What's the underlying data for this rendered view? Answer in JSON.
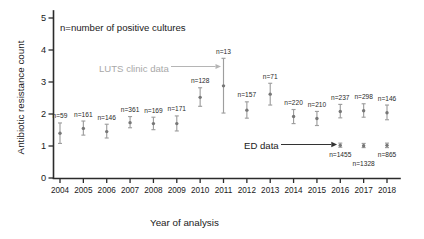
{
  "chart_data": {
    "type": "scatter",
    "title": "",
    "xlabel": "Year of analysis",
    "ylabel": "Antibiotic resistance count",
    "xlim": [
      2003.4,
      2018.7
    ],
    "ylim": [
      0,
      5.25
    ],
    "yticks": [
      0,
      1,
      2,
      3,
      4,
      5
    ],
    "grid": false,
    "legend": "none",
    "note": "n=number of positive cultures",
    "categories": [
      2004,
      2005,
      2006,
      2007,
      2008,
      2009,
      2010,
      2011,
      2012,
      2013,
      2014,
      2015,
      2016,
      2017,
      2018
    ],
    "series": [
      {
        "name": "LUTS clinic data",
        "color": "#777777",
        "errorbars": true,
        "points": [
          {
            "x": 2004,
            "y": 1.4,
            "lo": 1.08,
            "hi": 1.72,
            "n": 59,
            "n_label": "n=59",
            "label_pos": "above"
          },
          {
            "x": 2005,
            "y": 1.55,
            "lo": 1.34,
            "hi": 1.78,
            "n": 161,
            "n_label": "n=161",
            "label_pos": "above"
          },
          {
            "x": 2006,
            "y": 1.45,
            "lo": 1.25,
            "hi": 1.68,
            "n": 146,
            "n_label": "n=146",
            "label_pos": "above"
          },
          {
            "x": 2007,
            "y": 1.73,
            "lo": 1.57,
            "hi": 1.92,
            "n": 361,
            "n_label": "n=361",
            "label_pos": "above"
          },
          {
            "x": 2008,
            "y": 1.7,
            "lo": 1.51,
            "hi": 1.9,
            "n": 169,
            "n_label": "n=169",
            "label_pos": "above"
          },
          {
            "x": 2009,
            "y": 1.7,
            "lo": 1.47,
            "hi": 1.94,
            "n": 171,
            "n_label": "n=171",
            "label_pos": "above"
          },
          {
            "x": 2010,
            "y": 2.52,
            "lo": 2.24,
            "hi": 2.82,
            "n": 128,
            "n_label": "n=128",
            "label_pos": "above"
          },
          {
            "x": 2011,
            "y": 2.88,
            "lo": 2.03,
            "hi": 3.74,
            "n": 13,
            "n_label": "n=13",
            "label_pos": "above"
          },
          {
            "x": 2012,
            "y": 2.12,
            "lo": 1.87,
            "hi": 2.38,
            "n": 157,
            "n_label": "n=157",
            "label_pos": "above"
          },
          {
            "x": 2013,
            "y": 2.62,
            "lo": 2.28,
            "hi": 2.96,
            "n": 71,
            "n_label": "n=71",
            "label_pos": "above"
          },
          {
            "x": 2014,
            "y": 1.92,
            "lo": 1.7,
            "hi": 2.14,
            "n": 220,
            "n_label": "n=220",
            "label_pos": "above"
          },
          {
            "x": 2015,
            "y": 1.86,
            "lo": 1.64,
            "hi": 2.08,
            "n": 210,
            "n_label": "n=210",
            "label_pos": "above"
          },
          {
            "x": 2016,
            "y": 2.08,
            "lo": 1.88,
            "hi": 2.3,
            "n": 237,
            "n_label": "n=237",
            "label_pos": "above"
          },
          {
            "x": 2017,
            "y": 2.1,
            "lo": 1.9,
            "hi": 2.32,
            "n": 298,
            "n_label": "n=298",
            "label_pos": "above"
          },
          {
            "x": 2018,
            "y": 2.04,
            "lo": 1.82,
            "hi": 2.28,
            "n": 146,
            "n_label": "n=146",
            "label_pos": "above"
          }
        ]
      },
      {
        "name": "ED data",
        "color": "#777777",
        "errorbars": true,
        "points": [
          {
            "x": 2016,
            "y": 1.02,
            "lo": 0.96,
            "hi": 1.09,
            "n": 1455,
            "n_label": "n=1455",
            "label_pos": "below"
          },
          {
            "x": 2017,
            "y": 1.01,
            "lo": 0.95,
            "hi": 1.08,
            "n": 1328,
            "n_label": "n=1328",
            "label_pos": "below2"
          },
          {
            "x": 2018,
            "y": 1.02,
            "lo": 0.95,
            "hi": 1.09,
            "n": 865,
            "n_label": "n=865",
            "label_pos": "below"
          }
        ]
      }
    ],
    "annotations": [
      {
        "name": "luts-annotation",
        "text": "LUTS clinic data",
        "color": "#a8a8a8",
        "points_to": 2011
      },
      {
        "name": "ed-annotation",
        "text": "ED data",
        "color": "#1a1a1a",
        "points_to": 2016
      }
    ]
  },
  "axes": {
    "xlabel": "Year of analysis",
    "ylabel": "Antibiotic resistance count",
    "xticklabels": [
      "2004",
      "2005",
      "2006",
      "2007",
      "2008",
      "2009",
      "2010",
      "2011",
      "2012",
      "2013",
      "2014",
      "2015",
      "2016",
      "2017",
      "2018"
    ],
    "yticklabels": [
      "0",
      "1",
      "2",
      "3",
      "4",
      "5"
    ]
  },
  "note": {
    "text": "n=number of positive cultures"
  },
  "annotations": {
    "luts": "LUTS clinic data",
    "ed": "ED data"
  },
  "colors": {
    "axis": "#2b2b2b",
    "point": "#777777",
    "error": "#9e9e9e",
    "luts_label": "#a8a8a8",
    "ed_label": "#1a1a1a"
  }
}
